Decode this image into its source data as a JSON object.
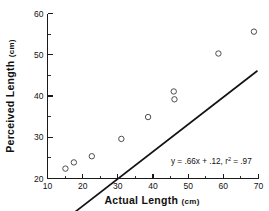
{
  "chart_data": {
    "type": "scatter",
    "title": "",
    "xlabel": "Actual Length",
    "xlabel_unit": "(cm)",
    "ylabel": "Perceived  Length",
    "ylabel_unit": "(cm)",
    "xlim": [
      10,
      70
    ],
    "ylim": [
      20,
      60
    ],
    "xticks": [
      10,
      20,
      30,
      40,
      50,
      60,
      70
    ],
    "xtick_labels": [
      "10",
      "20",
      "30",
      "40",
      "50",
      "60",
      "70"
    ],
    "yticks": [
      20,
      30,
      40,
      50,
      60
    ],
    "ytick_labels": [
      "20",
      "30",
      "40",
      "50",
      "60"
    ],
    "x_minor_step": 5,
    "y_minor_step": 5,
    "grid": false,
    "legend": null,
    "marker": "open-circle",
    "points": [
      {
        "x": 15.1,
        "y": 22.4
      },
      {
        "x": 17.5,
        "y": 23.9
      },
      {
        "x": 22.6,
        "y": 25.4
      },
      {
        "x": 31.0,
        "y": 29.6
      },
      {
        "x": 38.6,
        "y": 34.9
      },
      {
        "x": 45.9,
        "y": 41.1
      },
      {
        "x": 46.1,
        "y": 39.2
      },
      {
        "x": 58.6,
        "y": 50.3
      },
      {
        "x": 68.7,
        "y": 55.6
      }
    ],
    "fit_line": {
      "slope": 0.66,
      "intercept": 0.12,
      "x_start": 13.6,
      "x_end": 69.7
    },
    "annotation": {
      "prefix": "y = .66x + .12, r",
      "superscript": "2",
      "suffix": " = .97"
    }
  },
  "colors": {
    "axis": "#1a1a1a",
    "line": "#131313",
    "marker_stroke": "#444444",
    "text": "#111111",
    "background": "#ffffff"
  }
}
